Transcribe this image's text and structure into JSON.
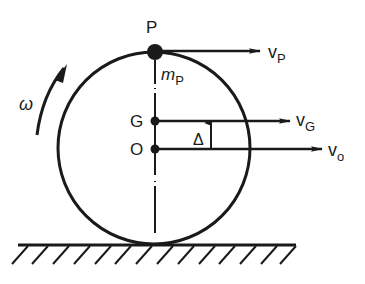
{
  "diagram": {
    "type": "rolling-wheel-kinematics",
    "labels": {
      "point_top": "P",
      "mass_top": "m",
      "mass_top_sub": "P",
      "center_mass": "G",
      "center": "O",
      "offset": "Δ",
      "angular_velocity": "ω",
      "velocity_p": "v",
      "velocity_p_sub": "P",
      "velocity_g": "v",
      "velocity_g_sub": "G",
      "velocity_o": "v",
      "velocity_o_sub": "o"
    },
    "colors": {
      "ink": "#1a1a1a",
      "background": "#ffffff"
    }
  }
}
